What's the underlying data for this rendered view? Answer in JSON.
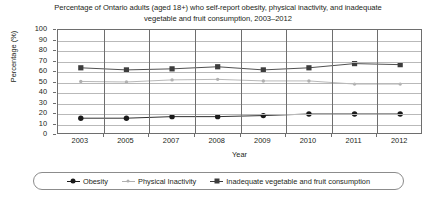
{
  "chart_data": {
    "type": "line",
    "title": "Percentage of Ontario adults (aged 18+) who self-report obesity, physical inactivity, and inadequate vegetable and fruit consumption, 2003–2012",
    "xlabel": "Year",
    "ylabel": "Percentage (%)",
    "categories": [
      "2003",
      "2005",
      "2007",
      "2008",
      "2009",
      "2010",
      "2011",
      "2012"
    ],
    "ylim": [
      0,
      100
    ],
    "yticks": [
      0,
      10,
      20,
      30,
      40,
      50,
      60,
      70,
      80,
      90,
      100
    ],
    "grid": "horizontal-and-vertical",
    "legend_position": "bottom",
    "series": [
      {
        "name": "Obesity",
        "marker": "circle",
        "color": "#1a1a1a",
        "values": [
          16,
          16,
          17.5,
          17.5,
          18.5,
          20,
          20,
          20
        ]
      },
      {
        "name": "Physical Inactivity",
        "marker": "dot",
        "color": "#b0b0b0",
        "values": [
          51,
          50.5,
          52.5,
          53,
          51.5,
          51.5,
          48.5,
          48.5
        ]
      },
      {
        "name": "Inadequate vegetable and fruit consumption",
        "marker": "square",
        "color": "#3d3d3d",
        "values": [
          64,
          62,
          63,
          65,
          62,
          64,
          68,
          67
        ]
      }
    ]
  },
  "colors": {
    "axis": "#6e6e6e",
    "gridline": "#b9b9b9",
    "text": "#231f20",
    "background": "#ffffff",
    "legend_border": "#8c8c8c"
  }
}
